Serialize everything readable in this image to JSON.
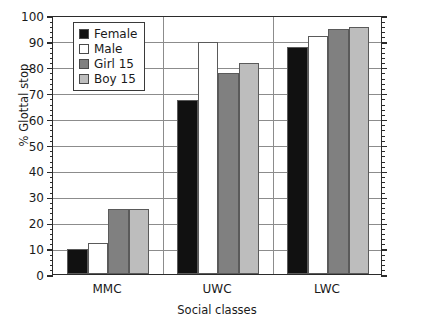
{
  "chart_data": {
    "type": "bar",
    "title": "",
    "subtitle": "",
    "xlabel": "Social classes",
    "ylabel": "% Glottal stop",
    "categories": [
      "MMC",
      "UWC",
      "LWC"
    ],
    "series": [
      {
        "name": "Female",
        "color": "#111111",
        "values": [
          9.5,
          67,
          87.5
        ]
      },
      {
        "name": "Male",
        "color": "#ffffff",
        "values": [
          12,
          89.5,
          92
        ]
      },
      {
        "name": "Girl 15",
        "color": "#808080",
        "values": [
          25,
          77.5,
          94.5
        ]
      },
      {
        "name": "Boy 15",
        "color": "#bdbdbd",
        "values": [
          25,
          81.5,
          95.5
        ]
      }
    ],
    "ylim": [
      0,
      100
    ],
    "ytick_step": 10,
    "yminor_step": 2,
    "yticks": [
      "0",
      "10",
      "20",
      "30",
      "40",
      "50",
      "60",
      "70",
      "80",
      "90",
      "100"
    ],
    "grid": true,
    "legend_position": "upper-left-inside",
    "legend_entries": [
      "Female",
      "Male",
      "Girl 15",
      "Boy 15"
    ],
    "axis_color": "#2b2b2b",
    "grid_color": "#8c8c8c",
    "bar_edge_color": "#5a5a5a",
    "background": "#ffffff"
  }
}
